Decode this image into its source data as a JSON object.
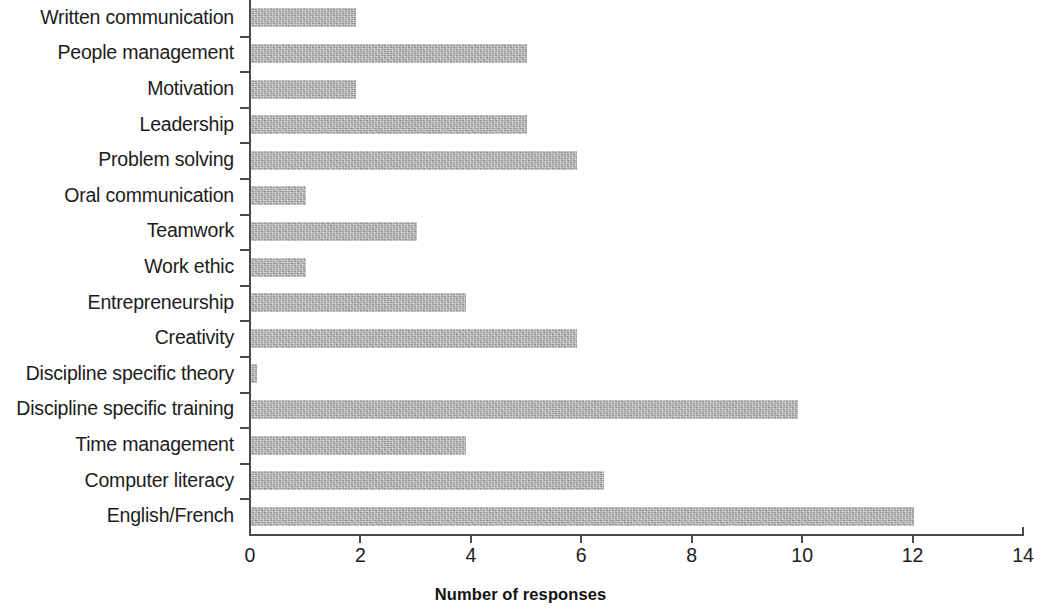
{
  "chart_data": {
    "type": "bar",
    "orientation": "horizontal",
    "title": "",
    "xlabel": "Number of responses",
    "ylabel": "",
    "xlim": [
      0,
      14
    ],
    "xticks": [
      "0",
      "2",
      "4",
      "6",
      "8",
      "10",
      "12",
      "14"
    ],
    "grid": false,
    "legend": false,
    "bar_color": "#ababab",
    "axis_color": "#4a4a4a",
    "categories": [
      "Written communication",
      "People management",
      "Motivation",
      "Leadership",
      "Problem solving",
      "Oral communication",
      "Teamwork",
      "Work ethic",
      "Entrepreneurship",
      "Creativity",
      "Discipline specific theory",
      "Discipline specific training",
      "Time management",
      "Computer literacy",
      "English/French"
    ],
    "values": [
      1.9,
      5.0,
      1.9,
      5.0,
      5.9,
      1.0,
      3.0,
      1.0,
      3.9,
      5.9,
      0.1,
      9.9,
      3.9,
      6.4,
      12.0
    ]
  }
}
